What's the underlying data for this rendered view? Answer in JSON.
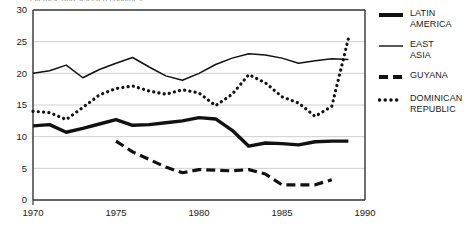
{
  "figure": {
    "title_fragment": "Literacy, and selected countries",
    "width": 469,
    "height": 228
  },
  "legend": {
    "position": "right",
    "entries": [
      {
        "label": "LATIN\nAMERICA",
        "style": "thick-solid",
        "color": "#111111",
        "name": "latin-america"
      },
      {
        "label": "EAST\nASIA",
        "style": "thin-solid",
        "color": "#111111",
        "name": "east-asia"
      },
      {
        "label": "GUYANA",
        "style": "dashed",
        "color": "#111111",
        "name": "guyana"
      },
      {
        "label": "DOMINICAN\nREPUBLIC",
        "style": "dotted",
        "color": "#111111",
        "name": "dominican-republic"
      }
    ]
  },
  "axes": {
    "x_label": "",
    "y_label": "",
    "x_ticks": [
      "1970",
      "1975",
      "1980",
      "1985",
      "1990"
    ],
    "y_ticks": [
      "0",
      "5",
      "10",
      "15",
      "20",
      "25",
      "30"
    ],
    "xlim": [
      1970,
      1990
    ],
    "ylim": [
      0,
      30
    ],
    "x_minor_step": 1,
    "grid": "horizontal"
  },
  "chart_data": {
    "type": "line",
    "title": "",
    "xlabel": "",
    "ylabel": "",
    "xlim": [
      1970,
      1990
    ],
    "ylim": [
      0,
      30
    ],
    "x_ticks": [
      1970,
      1975,
      1980,
      1985,
      1990
    ],
    "y_ticks": [
      0,
      5,
      10,
      15,
      20,
      25,
      30
    ],
    "grid": "horizontal-only",
    "legend_position": "right",
    "series": [
      {
        "name": "EAST ASIA",
        "style": "thin-solid",
        "color": "#111111",
        "x": [
          1970,
          1971,
          1972,
          1973,
          1974,
          1975,
          1976,
          1977,
          1978,
          1979,
          1980,
          1981,
          1982,
          1983,
          1984,
          1985,
          1986,
          1987,
          1988,
          1989
        ],
        "values": [
          20.0,
          20.4,
          21.3,
          19.3,
          20.6,
          21.6,
          22.5,
          21.0,
          19.6,
          18.9,
          20.0,
          21.4,
          22.4,
          23.1,
          22.9,
          22.4,
          21.6,
          22.0,
          22.3,
          22.2
        ]
      },
      {
        "name": "DOMINICAN REPUBLIC",
        "style": "dotted",
        "color": "#111111",
        "x": [
          1970,
          1971,
          1972,
          1973,
          1974,
          1975,
          1976,
          1977,
          1978,
          1979,
          1980,
          1981,
          1982,
          1983,
          1984,
          1985,
          1986,
          1987,
          1988,
          1989
        ],
        "values": [
          14.0,
          13.8,
          12.7,
          14.6,
          16.6,
          17.6,
          18.0,
          17.2,
          16.7,
          17.4,
          16.9,
          14.9,
          16.7,
          19.8,
          18.5,
          16.3,
          15.3,
          13.2,
          14.8,
          25.5
        ]
      },
      {
        "name": "LATIN AMERICA",
        "style": "thick-solid",
        "color": "#111111",
        "x": [
          1970,
          1971,
          1972,
          1973,
          1974,
          1975,
          1976,
          1977,
          1978,
          1979,
          1980,
          1981,
          1982,
          1983,
          1984,
          1985,
          1986,
          1987,
          1988,
          1989
        ],
        "values": [
          11.7,
          11.9,
          10.7,
          11.3,
          12.0,
          12.7,
          11.8,
          11.9,
          12.2,
          12.5,
          13.0,
          12.8,
          11.0,
          8.5,
          9.0,
          8.9,
          8.7,
          9.2,
          9.3,
          9.3
        ]
      },
      {
        "name": "GUYANA",
        "style": "dashed",
        "color": "#111111",
        "x": [
          1975,
          1976,
          1977,
          1978,
          1979,
          1980,
          1981,
          1982,
          1983,
          1984,
          1985,
          1986,
          1987,
          1988
        ],
        "values": [
          9.3,
          7.6,
          6.4,
          5.2,
          4.3,
          4.8,
          4.7,
          4.6,
          4.8,
          4.1,
          2.4,
          2.4,
          2.4,
          3.2
        ]
      }
    ]
  }
}
